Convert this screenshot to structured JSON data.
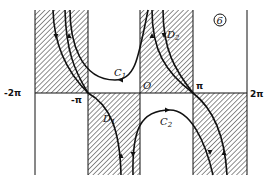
{
  "figure": {
    "panel_label": "6",
    "axis_labels": {
      "neg_two_pi": "-2π",
      "neg_pi": "-π",
      "origin": "O",
      "pi": "π",
      "two_pi": "2π"
    },
    "curve_labels": {
      "c1": "C",
      "c1_sub": "1",
      "c2": "C",
      "c2_sub": "2",
      "d1": "D",
      "d1_sub": "1",
      "d2": "D",
      "d2_sub": "2"
    },
    "colors": {
      "ink": "#111111",
      "hatch": "#333333",
      "background": "#ffffff"
    }
  }
}
